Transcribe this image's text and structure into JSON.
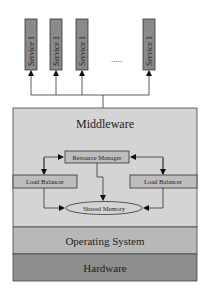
{
  "services": [
    {
      "label": "Service 1"
    },
    {
      "label": "Service 1"
    },
    {
      "label": "Service 1"
    },
    {
      "label": "Service 1"
    }
  ],
  "ellipsis": ".....",
  "layers": {
    "middleware": {
      "label": "Middleware",
      "color": "#d4d4d4"
    },
    "operating_system": {
      "label": "Operating System",
      "color": "#b8b8b8"
    },
    "hardware": {
      "label": "Hardware",
      "color": "#8e8e8e"
    }
  },
  "components": {
    "resource_manager": {
      "label": "Resource Manager"
    },
    "load_balancer_left": {
      "label": "Load Balancer"
    },
    "load_balancer_right": {
      "label": "Load Balancer"
    },
    "shared_memory": {
      "label": "Shared Memory"
    }
  },
  "colors": {
    "service_fill": "#8a8a8a",
    "component_fill": "#bdbdbd",
    "stroke": "#333333"
  }
}
